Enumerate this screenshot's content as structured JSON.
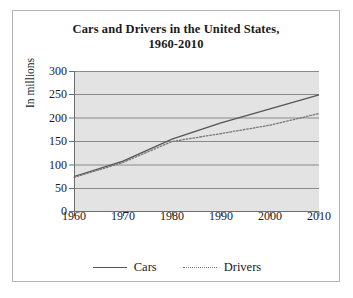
{
  "chart_data": {
    "type": "line",
    "title": "Cars and Drivers in the United States, 1960-2010",
    "title_lines": [
      "Cars and Drivers in the United States,",
      "1960-2010"
    ],
    "xlabel": "",
    "ylabel": "In millions",
    "x": [
      1960,
      1970,
      1980,
      1990,
      2000,
      2010
    ],
    "xlim": [
      1960,
      2010
    ],
    "ylim": [
      0,
      300
    ],
    "x_ticks": [
      "1960",
      "1970",
      "1980",
      "1990",
      "2000",
      "2010"
    ],
    "y_ticks": [
      "0",
      "50",
      "100",
      "150",
      "200",
      "250",
      "300"
    ],
    "y_tick_values": [
      0,
      50,
      100,
      150,
      200,
      250,
      300
    ],
    "grid": true,
    "legend_position": "bottom",
    "plot_background": "#e3e3e3",
    "series": [
      {
        "name": "Cars",
        "style": "solid",
        "color": "#555555",
        "values": [
          75,
          108,
          155,
          190,
          220,
          250
        ]
      },
      {
        "name": "Drivers",
        "style": "dotted",
        "color": "#777777",
        "values": [
          73,
          105,
          150,
          167,
          185,
          210
        ]
      }
    ]
  },
  "legend": {
    "entries": [
      {
        "label": "Cars",
        "style": "solid"
      },
      {
        "label": "Drivers",
        "style": "dotted"
      }
    ]
  }
}
